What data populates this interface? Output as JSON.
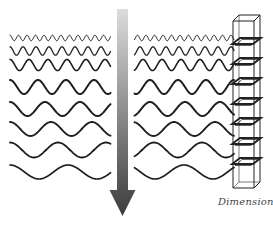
{
  "figure": {
    "label": "Dimensions",
    "arrow": {
      "x": 122.5,
      "y_top": 9,
      "y_shaft_end": 190,
      "y_tip": 216,
      "shaft_width": 11,
      "head_width": 26,
      "color_top": "#dcdcdc",
      "color_bottom": "#3c3c3c"
    },
    "waves": [
      {
        "y": 38,
        "amp": 2.8,
        "period": 8.5,
        "stroke": 1.0
      },
      {
        "y": 51,
        "amp": 4.2,
        "period": 13,
        "stroke": 1.3
      },
      {
        "y": 65,
        "amp": 5.5,
        "period": 19,
        "stroke": 1.6
      },
      {
        "y": 87,
        "amp": 7,
        "period": 28,
        "stroke": 2.0
      },
      {
        "y": 109,
        "amp": 7,
        "period": 35,
        "stroke": 2.0
      },
      {
        "y": 129,
        "amp": 7,
        "period": 41,
        "stroke": 1.9
      },
      {
        "y": 150,
        "amp": 7.5,
        "period": 48,
        "stroke": 1.8
      },
      {
        "y": 172,
        "amp": 7,
        "period": 58,
        "stroke": 1.7
      }
    ],
    "wave_x_start": 10,
    "wave_x_end": 234,
    "arrow_gap": 9,
    "tower": {
      "x": 233,
      "width": 21,
      "top": 21,
      "bottom": 188,
      "depth_dx": 6,
      "depth_dy": -6,
      "plates": [
        44,
        64,
        84,
        104,
        124,
        144,
        164
      ]
    },
    "colors": {
      "wave": "#1e1e1e",
      "tower": "#222222",
      "label": "#444444"
    }
  }
}
